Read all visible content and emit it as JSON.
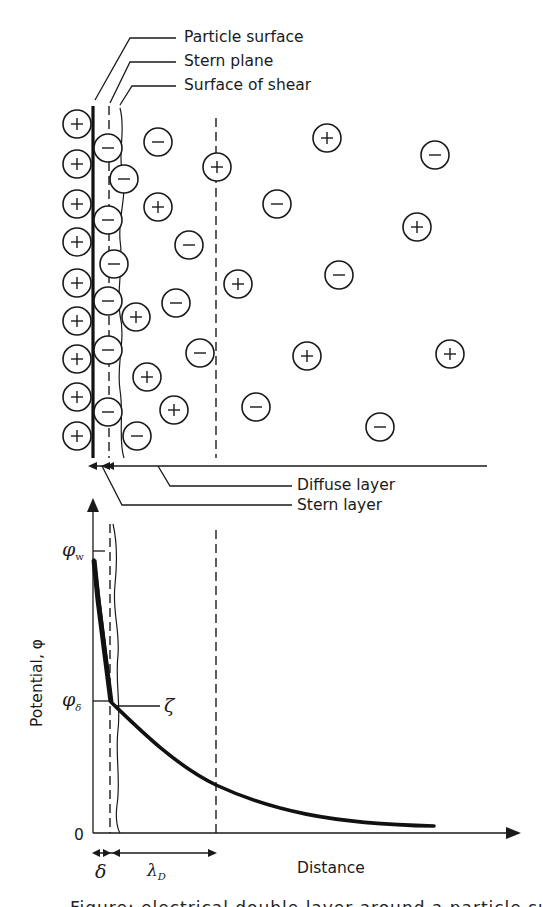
{
  "colors": {
    "ink": "#1a1a1a",
    "background": "#ffffff"
  },
  "labels": {
    "particle_surface": "Particle surface",
    "stern_plane": "Stern plane",
    "surface_of_shear": "Surface of shear",
    "diffuse_layer": "Diffuse layer",
    "stern_layer": "Stern layer",
    "y_axis": "Potential, φ",
    "x_axis": "Distance",
    "phi_w": "φ",
    "phi_w_sub": "w",
    "phi_delta": "φ",
    "phi_delta_sub": "δ",
    "zeta": "ζ",
    "zero": "0",
    "delta": "δ",
    "lambda": "λ",
    "lambda_sub": "D",
    "caption_cut": "Figure: electrical double layer around a particle surface"
  },
  "ions": {
    "wall_positive": [
      {
        "x": 77,
        "y": 124
      },
      {
        "x": 77,
        "y": 164
      },
      {
        "x": 77,
        "y": 204
      },
      {
        "x": 77,
        "y": 242
      },
      {
        "x": 77,
        "y": 283
      },
      {
        "x": 77,
        "y": 321
      },
      {
        "x": 77,
        "y": 359
      },
      {
        "x": 77,
        "y": 397
      },
      {
        "x": 77,
        "y": 436
      }
    ],
    "stern_negative": [
      {
        "x": 108,
        "y": 148
      },
      {
        "x": 124,
        "y": 179
      },
      {
        "x": 108,
        "y": 220
      },
      {
        "x": 114,
        "y": 264
      },
      {
        "x": 108,
        "y": 301
      },
      {
        "x": 108,
        "y": 350
      },
      {
        "x": 108,
        "y": 412
      }
    ],
    "diffuse": [
      {
        "x": 158,
        "y": 142,
        "sign": "-"
      },
      {
        "x": 217,
        "y": 167,
        "sign": "+"
      },
      {
        "x": 158,
        "y": 207,
        "sign": "+"
      },
      {
        "x": 189,
        "y": 245,
        "sign": "-"
      },
      {
        "x": 238,
        "y": 284,
        "sign": "+"
      },
      {
        "x": 176,
        "y": 303,
        "sign": "-"
      },
      {
        "x": 136,
        "y": 317,
        "sign": "+"
      },
      {
        "x": 200,
        "y": 353,
        "sign": "-"
      },
      {
        "x": 147,
        "y": 377,
        "sign": "+"
      },
      {
        "x": 174,
        "y": 410,
        "sign": "+"
      },
      {
        "x": 137,
        "y": 436,
        "sign": "-"
      },
      {
        "x": 327,
        "y": 138,
        "sign": "+"
      },
      {
        "x": 435,
        "y": 155,
        "sign": "-"
      },
      {
        "x": 277,
        "y": 204,
        "sign": "-"
      },
      {
        "x": 417,
        "y": 227,
        "sign": "+"
      },
      {
        "x": 339,
        "y": 275,
        "sign": "-"
      },
      {
        "x": 307,
        "y": 356,
        "sign": "+"
      },
      {
        "x": 450,
        "y": 354,
        "sign": "+"
      },
      {
        "x": 256,
        "y": 407,
        "sign": "-"
      },
      {
        "x": 380,
        "y": 427,
        "sign": "-"
      }
    ],
    "radius": 14
  },
  "chart_data": {
    "type": "line",
    "xlabel": "Distance",
    "ylabel": "Potential, φ",
    "y_ticks": [
      "φw",
      "φδ",
      "0"
    ],
    "x_annotations": [
      "δ (Stern layer thickness)",
      "λD (Debye length)"
    ],
    "annotations": [
      "ζ (zeta potential at surface of shear)"
    ],
    "series": [
      {
        "name": "Potential",
        "description": "Linear drop from φw to φδ across Stern layer, then exponential decay toward 0 in diffuse layer",
        "x_rel": [
          0,
          0.0,
          0.05,
          0.25,
          0.5,
          0.75,
          1.0
        ],
        "y_rel": [
          1.0,
          0.9,
          0.6,
          0.3,
          0.12,
          0.04,
          0.02
        ]
      }
    ],
    "grid": false,
    "legend": false
  }
}
